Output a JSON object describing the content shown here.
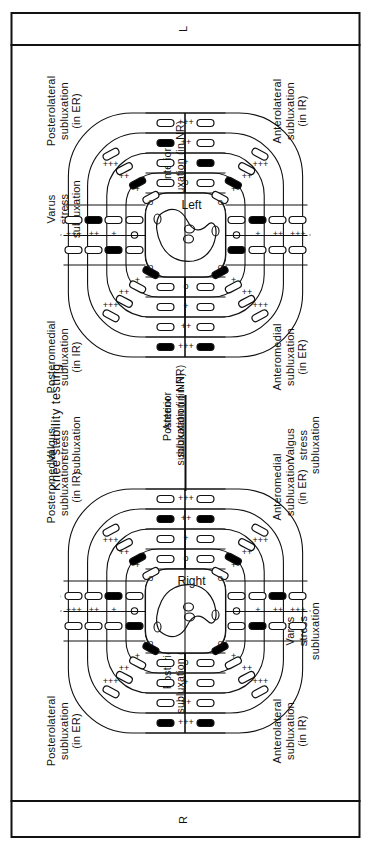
{
  "figure": {
    "title": "Knee stability testing",
    "left_marker": "L",
    "right_marker": "R",
    "knee_left_label": "Left",
    "knee_right_label": "Right",
    "grades": [
      "o",
      "+",
      "++",
      "+++"
    ],
    "angle_labels": [
      "0°",
      "30°"
    ],
    "flexion_labels": [
      "0– 30°",
      "60°–90°"
    ],
    "line_color": "#111111",
    "fill_color": "#000000",
    "background": "#ffffff"
  },
  "sections": {
    "posterolateral": "Posterolateral\nsubluxation\n(in ER)",
    "anterolateral": "Anterolateral\nsubluxation\n(in IR)",
    "posteromedial": "Posteromedial\nsubluxation\n(in IR)",
    "anteromedial": "Anteromedial\nsubluxation\n(in ER)",
    "posterior_nr": "Posterior\nsubluxation (in NR)",
    "anterior_nr": "Anterior\nsubluxation (in NR)",
    "varus": "Varus\nstress\nsubluxation",
    "valgus": "Valgus\nstress\nsubluxation",
    "posterior_short": "Posterior",
    "anterior_short": "Anterior"
  },
  "chart_data": {
    "type": "table",
    "title": "Knee stability testing",
    "knees": [
      {
        "name": "Left",
        "marked_cells": [
          {
            "zone": "upper-left-arc",
            "ring": "o",
            "state": "filled"
          },
          {
            "zone": "upper-center-0deg",
            "ring": "+",
            "state": "filled"
          },
          {
            "zone": "upper-center-30deg",
            "ring": "++",
            "state": "filled"
          },
          {
            "zone": "upper-right-arc",
            "ring": "+",
            "state": "filled"
          },
          {
            "zone": "lower-left-arc",
            "ring": "o",
            "state": "filled"
          },
          {
            "zone": "lower-center-0deg",
            "ring": "o",
            "state": "filled"
          },
          {
            "zone": "lower-center-30deg",
            "ring": "+",
            "state": "filled"
          },
          {
            "zone": "lower-right-arc",
            "ring": "+",
            "state": "filled"
          },
          {
            "zone": "post-row-60-90",
            "col": "+++",
            "state": "filled"
          },
          {
            "zone": "post-row-0-30",
            "col": "+++",
            "state": "filled"
          },
          {
            "zone": "ant-row-60-90",
            "col": "++",
            "state": "filled"
          },
          {
            "zone": "ant-row-0-30",
            "col": "+",
            "state": "filled"
          }
        ]
      },
      {
        "name": "Right",
        "marked_cells": [
          {
            "zone": "upper-center-30deg",
            "ring": "+",
            "state": "filled"
          },
          {
            "zone": "upper-right-arc",
            "ring": "+",
            "state": "filled"
          },
          {
            "zone": "upper-left-arc",
            "ring": "o",
            "state": "filled"
          },
          {
            "zone": "upper-center-0deg",
            "ring": "o",
            "state": "filled"
          },
          {
            "zone": "lower-left-arc",
            "ring": "o",
            "state": "filled"
          },
          {
            "zone": "lower-center-0deg",
            "ring": "+",
            "state": "filled"
          },
          {
            "zone": "lower-center-30deg",
            "ring": "++",
            "state": "filled"
          },
          {
            "zone": "lower-right-arc",
            "ring": "+",
            "state": "filled"
          },
          {
            "zone": "post-row-60-90",
            "col": "+++",
            "state": "filled"
          },
          {
            "zone": "post-row-0-30",
            "col": "+++",
            "state": "filled"
          },
          {
            "zone": "ant-row-60-90",
            "col": "++",
            "state": "filled"
          },
          {
            "zone": "ant-row-0-30",
            "col": "++",
            "state": "filled"
          }
        ]
      }
    ]
  }
}
